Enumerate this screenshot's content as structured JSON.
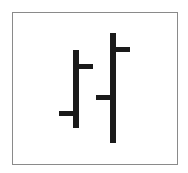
{
  "icon": {
    "name": "ohlc-bar-chart-icon",
    "label": "OHLC bar chart",
    "stroke_color": "#1a1a1a",
    "border_color": "#8a8a8a",
    "background": "#ffffff"
  },
  "bars": [
    {
      "name": "bar-1",
      "high_y": 50,
      "low_y": 128,
      "open_y": 113,
      "close_y": 66,
      "x": 73
    },
    {
      "name": "bar-2",
      "high_y": 33,
      "low_y": 143,
      "open_y": 97,
      "close_y": 49,
      "x": 110
    }
  ]
}
